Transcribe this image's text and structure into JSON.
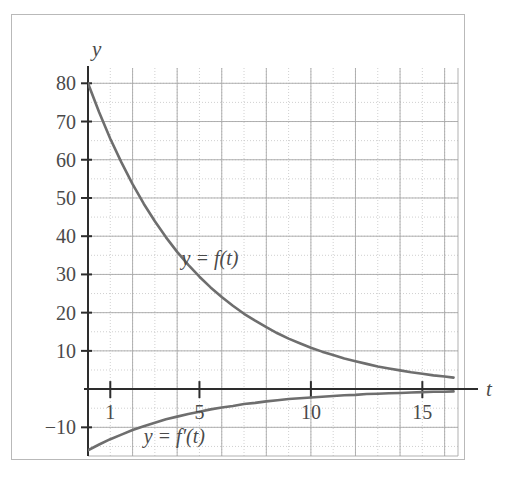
{
  "figure": {
    "background_color": "#ffffff",
    "frame_color": "#b9b9b9",
    "axis_color": "#2d2d2d",
    "curve_color": "#6e6e6e",
    "major_grid_color": "#a8a8a8",
    "minor_grid_color": "#c4c4c4",
    "tick_label_color": "#4a4a4a"
  },
  "axis_labels": {
    "y_axis": "y",
    "x_axis": "t"
  },
  "y_ticks": [
    "80",
    "70",
    "60",
    "50",
    "40",
    "30",
    "20",
    "10",
    "−10"
  ],
  "x_ticks": [
    "1",
    "5",
    "10",
    "15"
  ],
  "curve_labels": {
    "f": "y = f(t)",
    "f_prime": "y = f′(t)"
  },
  "chart_data": {
    "type": "line",
    "title": "",
    "xlabel": "t",
    "ylabel": "y",
    "xlim": [
      0,
      16.6
    ],
    "ylim": [
      -17.5,
      84
    ],
    "grid": true,
    "grid_major_x_step": 2,
    "grid_minor_x_step": 1,
    "grid_major_y_step": 10,
    "grid_minor_y_step": 5,
    "x_tick_values": [
      1,
      5,
      10,
      15
    ],
    "x_tick_labels": [
      "1",
      "5",
      "10",
      "15"
    ],
    "y_tick_values": [
      -10,
      10,
      20,
      30,
      40,
      50,
      60,
      70,
      80
    ],
    "y_tick_labels": [
      "−10",
      "10",
      "20",
      "30",
      "40",
      "50",
      "60",
      "70",
      "80"
    ],
    "legend": "inline-annotations",
    "annotations": [
      {
        "text": "y = f(t)",
        "x": 4.2,
        "y": 34
      },
      {
        "text": "y = f′(t)",
        "x": 2.5,
        "y": -12.5
      }
    ],
    "series": [
      {
        "name": "y = f(t)",
        "label": "y = f(t)",
        "color": "#6e6e6e",
        "x": [
          0,
          0.5,
          1,
          1.5,
          2,
          2.5,
          3,
          3.5,
          4,
          4.5,
          5,
          5.5,
          6,
          6.5,
          7,
          7.5,
          8,
          8.5,
          9,
          9.5,
          10,
          10.5,
          11,
          11.5,
          12,
          12.5,
          13,
          13.5,
          14,
          14.5,
          15,
          15.5,
          16,
          16.4
        ],
        "values": [
          80,
          72.4,
          65.5,
          59.3,
          53.6,
          48.5,
          43.9,
          39.7,
          35.9,
          32.5,
          29.4,
          26.6,
          24.1,
          21.8,
          19.7,
          17.9,
          16.2,
          14.6,
          13.2,
          12.0,
          10.8,
          9.8,
          8.9,
          8.0,
          7.3,
          6.6,
          5.9,
          5.4,
          4.9,
          4.4,
          4.0,
          3.6,
          3.3,
          3.0
        ],
        "function": "f(t) = 80·e^(−0.2t)"
      },
      {
        "name": "y = f'(t)",
        "label": "y = f′(t)",
        "color": "#6e6e6e",
        "x": [
          0,
          0.5,
          1,
          1.5,
          2,
          2.5,
          3,
          3.5,
          4,
          4.5,
          5,
          5.5,
          6,
          6.5,
          7,
          7.5,
          8,
          8.5,
          9,
          9.5,
          10,
          10.5,
          11,
          11.5,
          12,
          12.5,
          13,
          13.5,
          14,
          14.5,
          15,
          15.5,
          16,
          16.4
        ],
        "values": [
          -16.0,
          -14.5,
          -13.1,
          -11.9,
          -10.7,
          -9.7,
          -8.8,
          -7.9,
          -7.2,
          -6.5,
          -5.9,
          -5.3,
          -4.8,
          -4.4,
          -3.9,
          -3.6,
          -3.2,
          -2.9,
          -2.6,
          -2.4,
          -2.2,
          -2.0,
          -1.8,
          -1.6,
          -1.5,
          -1.3,
          -1.2,
          -1.1,
          -1.0,
          -0.9,
          -0.8,
          -0.7,
          -0.7,
          -0.6
        ],
        "function": "f′(t) = −16·e^(−0.2t)"
      }
    ]
  }
}
